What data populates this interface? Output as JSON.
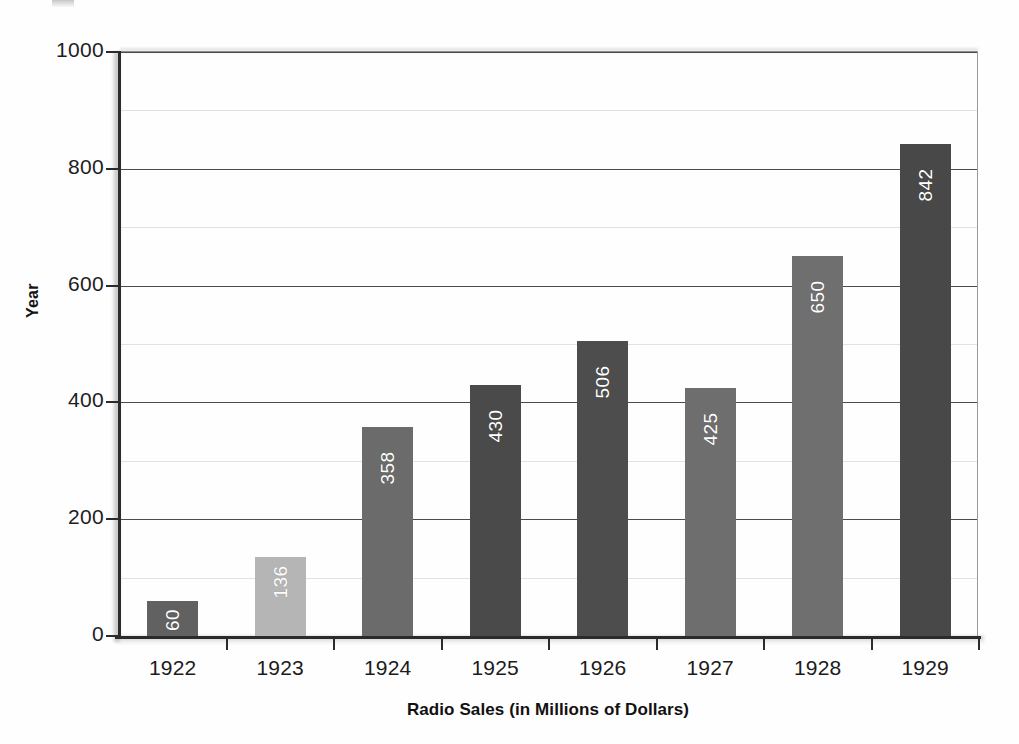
{
  "chart_data": {
    "type": "bar",
    "title": "",
    "xlabel": "Radio Sales (in Millions of Dollars)",
    "ylabel": "Year",
    "categories": [
      "1922",
      "1923",
      "1924",
      "1925",
      "1926",
      "1927",
      "1928",
      "1929"
    ],
    "values": [
      60,
      136,
      358,
      430,
      506,
      425,
      650,
      842
    ],
    "value_labels": [
      "60",
      "136",
      "358",
      "430",
      "506",
      "425",
      "650",
      "842"
    ],
    "bar_colors": [
      "#616161",
      "#b5b5b5",
      "#6b6b6b",
      "#4a4a4a",
      "#4d4d4d",
      "#6e6e6e",
      "#6f6f6f",
      "#484848"
    ],
    "ylim": [
      0,
      1000
    ],
    "ytick_values": [
      0,
      200,
      400,
      600,
      800,
      1000
    ],
    "ytick_labels": [
      "0",
      "200",
      "400",
      "600",
      "800",
      "1000"
    ],
    "minor_gridline_values": [
      100,
      300,
      500,
      700,
      900
    ],
    "grid": "major horizontal gridlines dark, minor horizontal gridlines faint",
    "legend": "none",
    "legend_position": "none",
    "value_label_position": "inside top of bar, rotated 90 degrees, white text",
    "series": [
      {
        "name": "Radio Sales",
        "values": [
          60,
          136,
          358,
          430,
          506,
          425,
          650,
          842
        ]
      }
    ]
  },
  "figure": {
    "background_color": "#fefefe",
    "axis_color": "#2b2b2b",
    "major_grid_color": "#4b4b4b",
    "minor_grid_color": "#e2e2e2",
    "label_color": "#1b1b1b"
  }
}
